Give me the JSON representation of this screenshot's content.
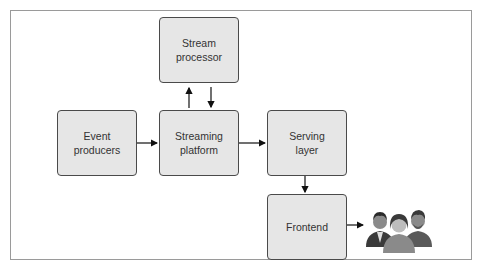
{
  "diagram": {
    "nodes": [
      {
        "id": "stream-processor",
        "label": "Stream\nprocessor"
      },
      {
        "id": "event-producers",
        "label": "Event\nproducers"
      },
      {
        "id": "streaming-platform",
        "label": "Streaming\nplatform"
      },
      {
        "id": "serving-layer",
        "label": "Serving\nlayer"
      },
      {
        "id": "frontend",
        "label": "Frontend"
      },
      {
        "id": "users",
        "label": "",
        "icon": "users-group-icon"
      }
    ],
    "edges": [
      {
        "from": "event-producers",
        "to": "streaming-platform"
      },
      {
        "from": "streaming-platform",
        "to": "stream-processor"
      },
      {
        "from": "stream-processor",
        "to": "streaming-platform"
      },
      {
        "from": "streaming-platform",
        "to": "serving-layer"
      },
      {
        "from": "serving-layer",
        "to": "frontend"
      },
      {
        "from": "frontend",
        "to": "users"
      }
    ],
    "colors": {
      "box_fill": "#e6e6e6",
      "box_border": "#4a4a4a",
      "arrow": "#111111"
    }
  }
}
